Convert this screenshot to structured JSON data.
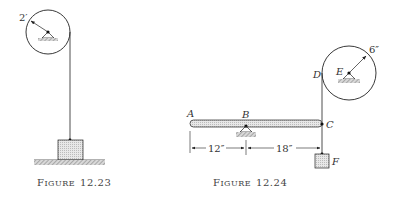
{
  "figures": [
    {
      "id": "fig-12-23",
      "caption_prefix": "F",
      "caption_word": "IGURE",
      "caption_number": "12.23",
      "pulley": {
        "radius_label": "2′"
      },
      "elements": [
        "pulley",
        "pivot-support",
        "rope",
        "block",
        "ground"
      ]
    },
    {
      "id": "fig-12-24",
      "caption_prefix": "F",
      "caption_word": "IGURE",
      "caption_number": "12.24",
      "pulley": {
        "radius_label": "6″",
        "center_label": "E"
      },
      "points": {
        "A": "A",
        "B": "B",
        "C": "C",
        "D": "D",
        "E": "E",
        "F": "F"
      },
      "dimensions": {
        "AB": "12″",
        "BC": "18″"
      },
      "elements": [
        "lever-bar",
        "fulcrum-B",
        "rope-DC",
        "pulley-E",
        "block-F"
      ]
    }
  ],
  "colors": {
    "ink": "#222222",
    "hatch": "#888888",
    "fill": "#e6e6e6",
    "background": "#ffffff"
  }
}
